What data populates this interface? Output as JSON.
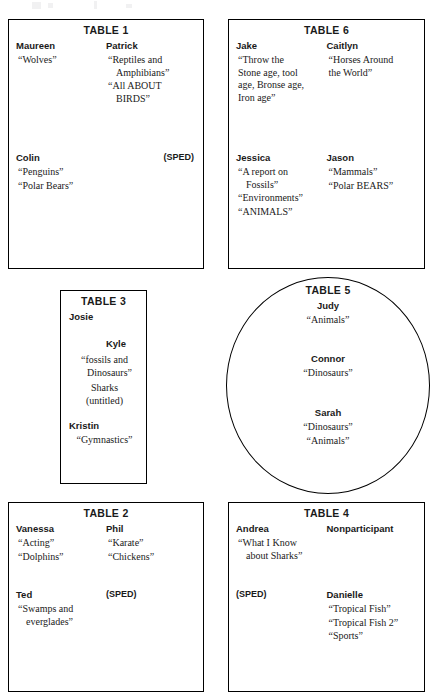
{
  "document": {
    "kind": "classroom-seating-chart",
    "tables": [
      {
        "id": "table-1",
        "title": "TABLE 1",
        "shape": "rectangle",
        "columns": [
          {
            "groups": [
              {
                "name": "Maureen",
                "topics": [
                  "“Wolves”"
                ]
              },
              {
                "name": "Colin",
                "topics": [
                  "“Penguins”",
                  "“Polar Bears”"
                ]
              }
            ]
          },
          {
            "groups": [
              {
                "name": "Patrick",
                "topics": [
                  "“Reptiles and",
                  "Amphibians”",
                  "“All ABOUT",
                  "BIRDS”"
                ]
              },
              {
                "name": "(SPED)",
                "topics": []
              }
            ]
          }
        ]
      },
      {
        "id": "table-6",
        "title": "TABLE 6",
        "shape": "rectangle",
        "columns": [
          {
            "groups": [
              {
                "name": "Jake",
                "topics": [
                  "“Throw the",
                  "Stone age, tool",
                  "age, Bronse age,",
                  "Iron age”"
                ]
              },
              {
                "name": "Jessica",
                "topics": [
                  "“A report on",
                  "Fossils”",
                  "“Environments”",
                  "“ANIMALS”"
                ]
              }
            ]
          },
          {
            "groups": [
              {
                "name": "Caitlyn",
                "topics": [
                  "“Horses Around",
                  "the World”"
                ]
              },
              {
                "name": "Jason",
                "topics": [
                  "“Mammals”",
                  "“Polar BEARS”"
                ]
              }
            ]
          }
        ]
      },
      {
        "id": "table-3",
        "title": "TABLE 3",
        "shape": "rectangle-narrow",
        "entries": [
          {
            "name": "Josie",
            "topics": []
          },
          {
            "name": "Kyle",
            "topics": [
              "“fossils and",
              "Dinosaurs”",
              "Sharks",
              "(untitled)"
            ]
          },
          {
            "name": "Kristin",
            "topics": [
              "“Gymnastics”"
            ]
          }
        ]
      },
      {
        "id": "table-5",
        "title": "TABLE 5",
        "shape": "oval",
        "entries": [
          {
            "name": "Judy",
            "topics": [
              "“Animals”"
            ]
          },
          {
            "name": "Connor",
            "topics": [
              "“Dinosaurs”"
            ]
          },
          {
            "name": "Sarah",
            "topics": [
              "“Dinosaurs”",
              "“Animals”"
            ]
          }
        ]
      },
      {
        "id": "table-2",
        "title": "TABLE 2",
        "shape": "rectangle",
        "columns": [
          {
            "groups": [
              {
                "name": "Vanessa",
                "topics": [
                  "“Acting”",
                  "“Dolphins”"
                ]
              },
              {
                "name": "Ted",
                "topics": [
                  "“Swamps and",
                  "everglades”"
                ]
              }
            ]
          },
          {
            "groups": [
              {
                "name": "Phil",
                "topics": [
                  "“Karate”",
                  "“Chickens”"
                ]
              },
              {
                "name": "(SPED)",
                "topics": []
              }
            ]
          }
        ]
      },
      {
        "id": "table-4",
        "title": "TABLE 4",
        "shape": "rectangle",
        "columns": [
          {
            "groups": [
              {
                "name": "Andrea",
                "topics": [
                  "“What I Know",
                  "about Sharks”"
                ]
              },
              {
                "name": "(SPED)",
                "topics": []
              }
            ]
          },
          {
            "groups": [
              {
                "name": "Nonparticipant",
                "topics": []
              },
              {
                "name": "Danielle",
                "topics": [
                  "“Tropical Fish”",
                  "“Tropical Fish 2”",
                  "“Sports”"
                ]
              }
            ]
          }
        ]
      }
    ]
  }
}
